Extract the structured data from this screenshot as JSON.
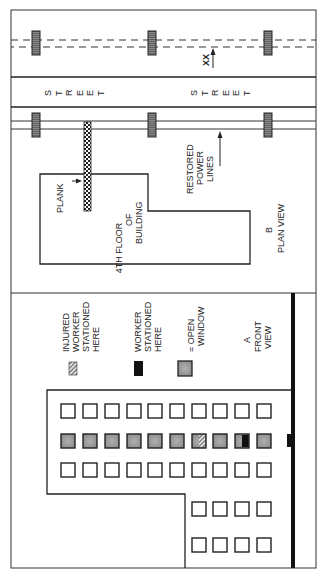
{
  "plan_view": {
    "caption_letter": "B",
    "caption": "PLAN VIEW",
    "street_label_1": "S T R E E T",
    "street_label_2": "S T R E E T",
    "street_letters": [
      "S",
      "T",
      "R",
      "E",
      "E",
      "T"
    ],
    "xx_label": "XX",
    "plank_label": "PLANK",
    "building_label_line1": "4TH FLOOR",
    "building_label_line2": "OF",
    "building_label_line3": "BUILDING",
    "power_label_line1": "RESTORED",
    "power_label_line2": "POWER",
    "power_label_line3": "LINES"
  },
  "front_view": {
    "caption_letter": "A",
    "caption_line1": "FRONT",
    "caption_line2": "VIEW",
    "legend": [
      {
        "symbol": "hatched",
        "line1": "INJURED",
        "line2": "WORKER",
        "line3": "STATIONED",
        "line4": "HERE"
      },
      {
        "symbol": "black",
        "line1": "WORKER",
        "line2": "STATIONED",
        "line3": "HERE"
      },
      {
        "symbol": "gray-window",
        "line1": "= OPEN",
        "line2": "WINDOW"
      }
    ]
  },
  "colors": {
    "line": "#222222",
    "open_window": "#9a9a9a",
    "pole": "#7a7a7a",
    "background": "#ffffff"
  }
}
